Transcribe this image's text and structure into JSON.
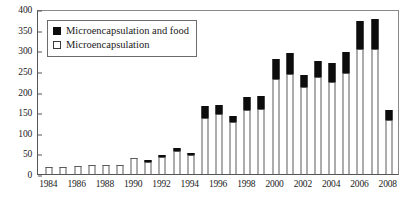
{
  "chart_data": {
    "type": "bar",
    "stacked": true,
    "title": "",
    "xlabel": "",
    "ylabel": "",
    "ylim": [
      0,
      400
    ],
    "ytick_step": 50,
    "yticks": [
      0,
      50,
      100,
      150,
      200,
      250,
      300,
      350,
      400
    ],
    "grid": false,
    "legend_position": "top-left",
    "categories": [
      "1984",
      "1985",
      "1986",
      "1987",
      "1988",
      "1989",
      "1990",
      "1991",
      "1992",
      "1993",
      "1994",
      "1995",
      "1996",
      "1997",
      "1998",
      "1999",
      "2000",
      "2001",
      "2002",
      "2003",
      "2004",
      "2005",
      "2006",
      "2007",
      "2008"
    ],
    "xtick_labels": [
      "1984",
      "1986",
      "1988",
      "1990",
      "1992",
      "1994",
      "1996",
      "1998",
      "2000",
      "2002",
      "2004",
      "2006",
      "2008"
    ],
    "series": [
      {
        "name": "Microencapsulation",
        "color": "#ffffff",
        "values": [
          18,
          16,
          19,
          23,
          21,
          21,
          38,
          30,
          45,
          57,
          49,
          137,
          145,
          126,
          155,
          157,
          230,
          243,
          210,
          234,
          224,
          244,
          303,
          303,
          130
        ]
      },
      {
        "name": "Microencapsulation and food",
        "color": "#0d0d0d",
        "values": [
          0,
          0,
          0,
          0,
          0,
          0,
          0,
          4,
          2,
          7,
          2,
          28,
          22,
          14,
          32,
          31,
          48,
          50,
          30,
          40,
          46,
          52,
          68,
          72,
          26
        ]
      }
    ],
    "totals": [
      18,
      16,
      19,
      23,
      21,
      21,
      38,
      34,
      47,
      64,
      51,
      165,
      167,
      140,
      187,
      188,
      278,
      293,
      240,
      274,
      270,
      296,
      371,
      375,
      156
    ]
  },
  "legend": {
    "items": [
      {
        "label": "Microencapsulation and food",
        "swatch": "filled"
      },
      {
        "label": "Microencapsulation",
        "swatch": "hollow"
      }
    ]
  }
}
